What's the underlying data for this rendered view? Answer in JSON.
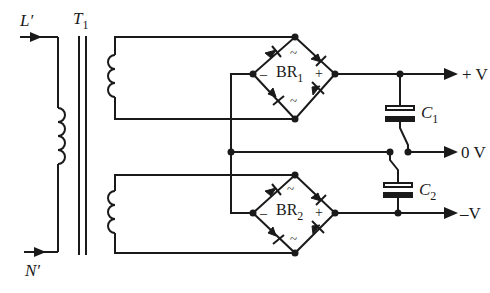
{
  "diagram": {
    "colors": {
      "line": "#1a1a1a",
      "background": "#ffffff"
    },
    "inputs": {
      "line": {
        "label": "L′"
      },
      "neutral": {
        "label": "N′"
      }
    },
    "transformer": {
      "label": "T",
      "subscript": "1"
    },
    "bridges": [
      {
        "label": "BR",
        "subscript": "1",
        "minus": "–",
        "plus": "+",
        "ac1": "~",
        "ac2": "~"
      },
      {
        "label": "BR",
        "subscript": "2",
        "minus": "–",
        "plus": "+",
        "ac1": "~",
        "ac2": "~"
      }
    ],
    "capacitors": [
      {
        "label": "C",
        "subscript": "1"
      },
      {
        "label": "C",
        "subscript": "2"
      }
    ],
    "outputs": [
      {
        "label": "+ V"
      },
      {
        "label": "0 V"
      },
      {
        "label": "–V"
      }
    ]
  }
}
